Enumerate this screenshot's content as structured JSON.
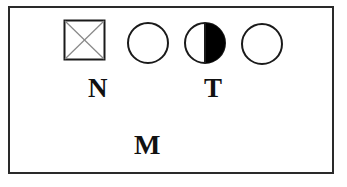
{
  "diagram": {
    "type": "pedigree-symbol-row",
    "symbols": [
      {
        "shape": "square",
        "marking": "crossed",
        "meaning": "male-deceased-or-crossed"
      },
      {
        "shape": "circle",
        "marking": "empty"
      },
      {
        "shape": "circle",
        "marking": "right-half-filled"
      },
      {
        "shape": "circle",
        "marking": "empty"
      }
    ],
    "labels": {
      "n": "N",
      "t": "T",
      "m": "M"
    },
    "colors": {
      "stroke": "#1a1a1a",
      "fill": "#000000",
      "background": "#ffffff",
      "cross": "#888888"
    }
  }
}
